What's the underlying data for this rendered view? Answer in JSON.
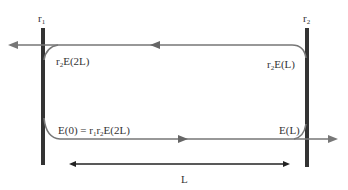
{
  "diagram": {
    "type": "laser-cavity-round-trip",
    "mirrors": [
      {
        "id": "r1",
        "label_main": "r",
        "label_sub": "1",
        "x": 43
      },
      {
        "id": "r2",
        "label_main": "r",
        "label_sub": "2",
        "x": 307
      }
    ],
    "field_labels": {
      "top_left": {
        "pre": "r",
        "sub": "2",
        "post": "E(2L)"
      },
      "top_right": {
        "pre": "r",
        "sub": "2",
        "post": "E(L)"
      },
      "bottom_left": {
        "text": "E(0) = r",
        "sub1": "1",
        "mid": "r",
        "sub2": "2",
        "post": "E(2L)"
      },
      "bottom_right": {
        "text": "E(L)"
      }
    },
    "length_label": "L",
    "colors": {
      "mirror": "#333333",
      "beam": "#777777",
      "length_arrow": "#222222",
      "text": "#333333"
    }
  }
}
